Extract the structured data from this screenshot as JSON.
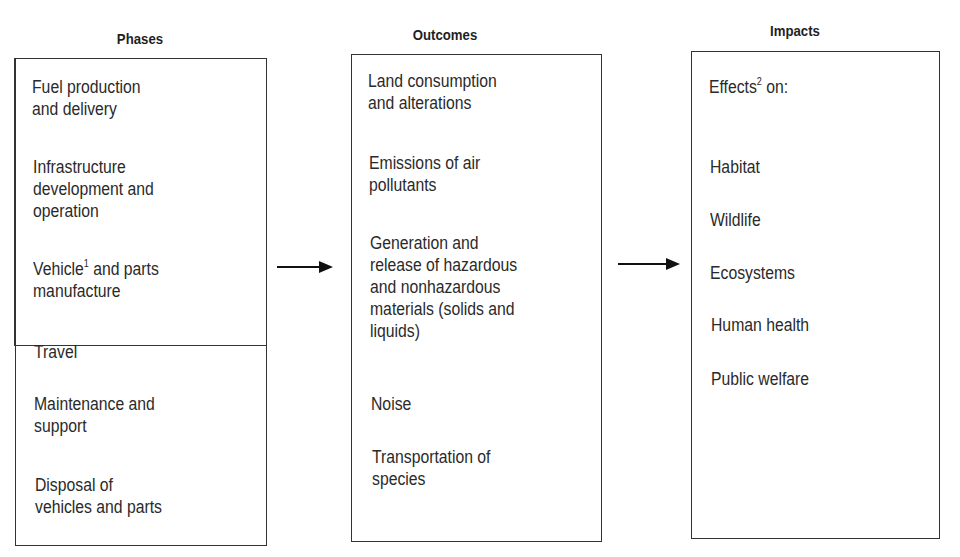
{
  "columns": [
    {
      "header": "Phases",
      "items": [
        {
          "lines": [
            "Fuel production",
            "and delivery"
          ]
        },
        {
          "lines": [
            "Infrastructure",
            "development and",
            "operation"
          ]
        },
        {
          "lines": [
            "Vehicle",
            "and parts",
            "manufacture"
          ],
          "footnote": "1"
        },
        {
          "lines": [
            "Travel"
          ]
        },
        {
          "lines": [
            "Maintenance and",
            "support"
          ]
        },
        {
          "lines": [
            "Disposal of",
            "vehicles and parts"
          ]
        }
      ]
    },
    {
      "header": "Outcomes",
      "items": [
        {
          "lines": [
            "Land consumption",
            "and alterations"
          ]
        },
        {
          "lines": [
            "Emissions of air",
            "pollutants"
          ]
        },
        {
          "lines": [
            "Generation and",
            "release of hazardous",
            "and nonhazardous",
            "materials (solids and",
            "liquids)"
          ]
        },
        {
          "lines": [
            "Noise"
          ]
        },
        {
          "lines": [
            "Transportation of",
            "species"
          ]
        }
      ]
    },
    {
      "header": "Impacts",
      "intro": {
        "text": "Effects",
        "footnote": "2",
        "suffix": " on:"
      },
      "items": [
        {
          "lines": [
            "Habitat"
          ]
        },
        {
          "lines": [
            "Wildlife"
          ]
        },
        {
          "lines": [
            "Ecosystems"
          ]
        },
        {
          "lines": [
            "Human health"
          ]
        },
        {
          "lines": [
            "Public welfare"
          ]
        }
      ]
    }
  ],
  "arrows": [
    "phases-to-outcomes",
    "outcomes-to-impacts"
  ]
}
